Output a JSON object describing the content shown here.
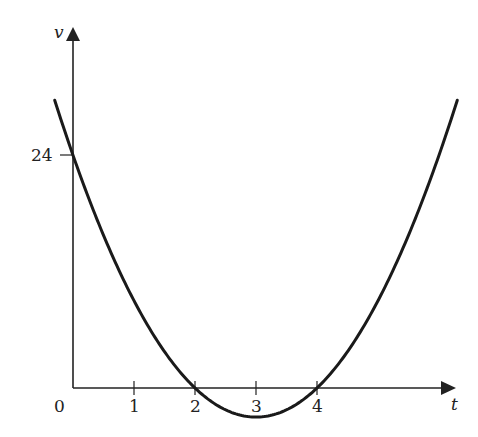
{
  "chart_data": {
    "type": "line",
    "title": "",
    "xlabel": "t",
    "ylabel": "v",
    "function": "v = 3t^2 - 18t + 24",
    "x_ticks": [
      "0",
      "1",
      "2",
      "3",
      "4"
    ],
    "y_ticks": [
      "24"
    ],
    "x_range": [
      -0.3,
      6.3
    ],
    "y_range": [
      -3,
      30
    ],
    "grid": false,
    "legend": null,
    "series": [
      {
        "name": "v(t)",
        "x": [
          -0.3,
          0,
          0.5,
          1,
          1.5,
          2,
          2.5,
          3,
          3.5,
          4,
          4.5,
          5,
          5.5,
          6,
          6.3
        ],
        "values": [
          29.67,
          24,
          15.75,
          9,
          3.75,
          0,
          -2.25,
          -3,
          -2.25,
          0,
          3.75,
          9,
          15.75,
          24,
          29.67
        ]
      }
    ],
    "annotations": [
      "zeros at t=2 and t=4",
      "v-intercept 24",
      "minimum at t=3"
    ]
  },
  "labels": {
    "origin": "0",
    "t1": "1",
    "t2": "2",
    "t3": "3",
    "t4": "4",
    "v24": "24",
    "x_axis": "t",
    "y_axis": "v"
  }
}
